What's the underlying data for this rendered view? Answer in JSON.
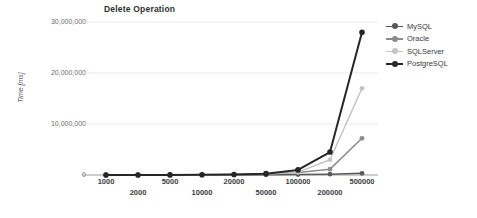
{
  "chart_data": {
    "type": "line",
    "title": "Delete Operation",
    "xlabel": "Number of operations",
    "ylabel": "Time [ms]",
    "categories": [
      "1000",
      "2000",
      "5000",
      "10000",
      "20000",
      "50000",
      "100000",
      "200000",
      "500000"
    ],
    "ylim": [
      0,
      30000000
    ],
    "yticks": [
      0,
      10000000,
      20000000,
      30000000
    ],
    "ytick_labels": [
      "0",
      "10,000,000",
      "20,000,000",
      "30,000,000"
    ],
    "grid": true,
    "legend_position": "right",
    "series": [
      {
        "name": "MySQL",
        "color": "#595959",
        "values": [
          1500,
          2600,
          5500,
          11000,
          22000,
          52000,
          96000,
          170000,
          330000
        ]
      },
      {
        "name": "Oracle",
        "color": "#8c8c8c",
        "values": [
          4000,
          7500,
          18000,
          36000,
          75000,
          210000,
          480000,
          1150000,
          7200000
        ]
      },
      {
        "name": "SQLServer",
        "color": "#c4c4c4",
        "values": [
          3500,
          6800,
          16000,
          33000,
          68000,
          190000,
          560000,
          3000000,
          17000000
        ]
      },
      {
        "name": "PostgreSQL",
        "color": "#262626",
        "values": [
          5000,
          9500,
          23000,
          47000,
          95000,
          260000,
          1000000,
          4500000,
          28000000
        ]
      }
    ]
  },
  "legend": {
    "items": [
      {
        "label": "MySQL"
      },
      {
        "label": "Oracle"
      },
      {
        "label": "SQLServer"
      },
      {
        "label": "PostgreSQL"
      }
    ]
  }
}
